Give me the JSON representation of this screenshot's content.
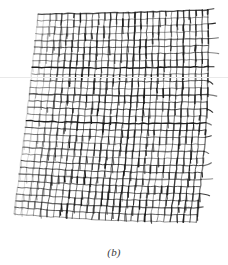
{
  "figure": {
    "caption": "(b)",
    "kind": "warped-mesh-scan",
    "background_color": "#ffffff",
    "ink_color": "#1a1a1a",
    "faint_ink_color": "#9a9a9a",
    "scan_artifact_color": "#e9e9e9",
    "scan_artifact_y": 77,
    "canvas": {
      "width": 228,
      "height": 265
    },
    "plot_area": {
      "x": 0,
      "y": 0,
      "width": 228,
      "height": 238
    }
  },
  "chart_data": {
    "type": "mesh",
    "title": "",
    "subtitle": "",
    "xlabel": "",
    "ylabel": "",
    "grid": true,
    "legend": null,
    "annotations": [
      "(b)"
    ],
    "xlim": [
      0,
      228
    ],
    "ylim": [
      0,
      238
    ],
    "corners": {
      "top_left": [
        38,
        14
      ],
      "top_right": [
        208,
        10
      ],
      "bottom_right": [
        196,
        222
      ],
      "bottom_left": [
        14,
        214
      ]
    },
    "rows": 30,
    "cols": 28,
    "row_spacing": 6.9,
    "col_spacing": 6.2,
    "warp_curvature": 0.16,
    "weft_curvature": 0.09,
    "tick_length": 7,
    "tick_probability": 0.62,
    "fade_left_fraction": 0.22,
    "line_width_major": 1.35,
    "line_width_minor": 0.8,
    "seed": 20240517
  }
}
